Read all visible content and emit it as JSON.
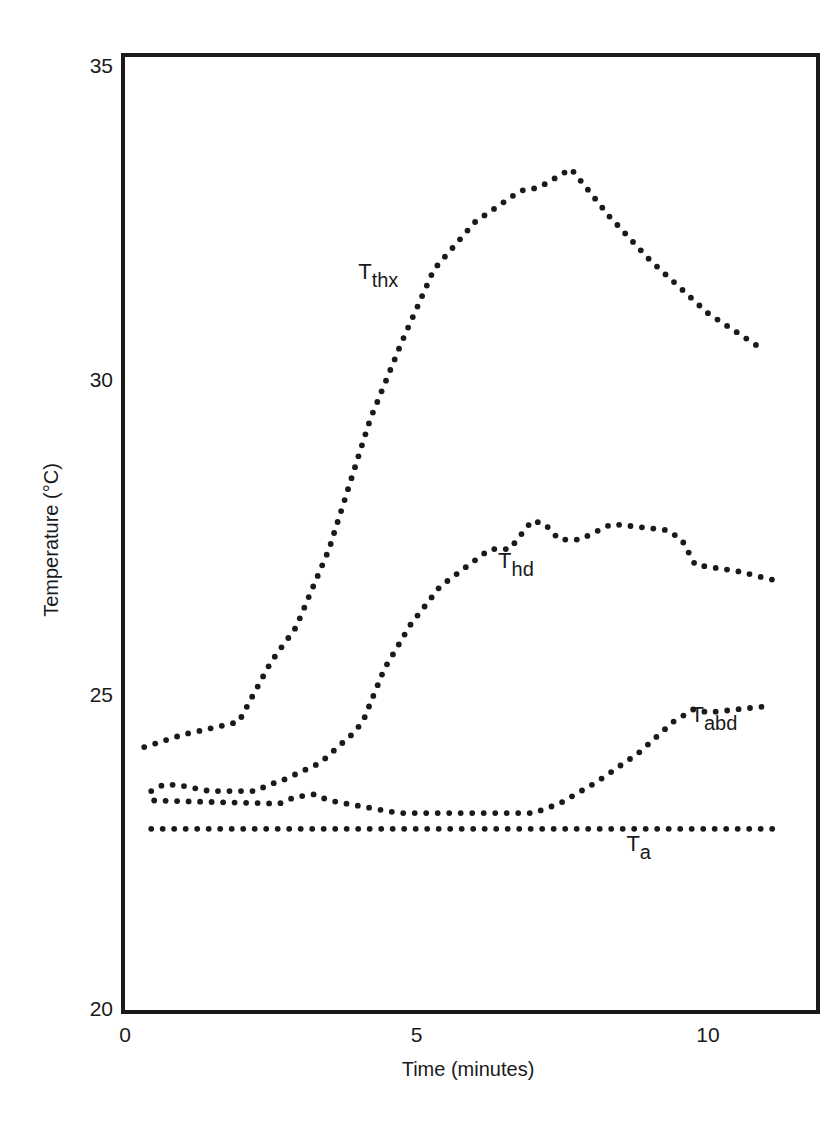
{
  "chart_data": {
    "type": "scatter",
    "style": "dotted-lines",
    "title": "",
    "xlabel": "Time (minutes)",
    "ylabel": "Temperature (°C)",
    "xlim": [
      0,
      12
    ],
    "ylim": [
      20,
      35
    ],
    "x_ticks": [
      0,
      5,
      10
    ],
    "y_ticks": [
      20,
      25,
      30,
      35
    ],
    "grid": false,
    "legend": "inline labels",
    "series": [
      {
        "name": "T_thx",
        "label_main": "T",
        "label_sub": "thx",
        "label_pos": [
          4.0,
          31.6
        ],
        "points": [
          [
            0.33,
            24.15
          ],
          [
            1.0,
            24.35
          ],
          [
            1.95,
            24.55
          ],
          [
            2.5,
            25.5
          ],
          [
            2.93,
            26.05
          ],
          [
            3.5,
            27.3
          ],
          [
            4.2,
            29.35
          ],
          [
            4.75,
            30.6
          ],
          [
            5.3,
            31.75
          ],
          [
            6.0,
            32.5
          ],
          [
            6.78,
            33.0
          ],
          [
            7.1,
            33.05
          ],
          [
            7.65,
            33.35
          ],
          [
            8.3,
            32.6
          ],
          [
            9.0,
            31.9
          ],
          [
            10.0,
            31.05
          ],
          [
            10.9,
            30.5
          ]
        ]
      },
      {
        "name": "T_hd",
        "label_main": "T",
        "label_sub": "hd",
        "label_pos": [
          6.4,
          27.0
        ],
        "points": [
          [
            0.45,
            23.45
          ],
          [
            0.65,
            23.55
          ],
          [
            0.9,
            23.55
          ],
          [
            1.45,
            23.45
          ],
          [
            2.25,
            23.45
          ],
          [
            2.45,
            23.55
          ],
          [
            2.65,
            23.6
          ],
          [
            3.0,
            23.75
          ],
          [
            3.35,
            23.9
          ],
          [
            3.95,
            24.4
          ],
          [
            4.1,
            24.6
          ],
          [
            4.45,
            25.4
          ],
          [
            4.9,
            26.1
          ],
          [
            5.4,
            26.7
          ],
          [
            5.9,
            27.05
          ],
          [
            6.26,
            27.3
          ],
          [
            6.6,
            27.3
          ],
          [
            6.98,
            27.75
          ],
          [
            7.2,
            27.7
          ],
          [
            7.45,
            27.45
          ],
          [
            7.8,
            27.45
          ],
          [
            8.35,
            27.7
          ],
          [
            9.3,
            27.6
          ],
          [
            9.55,
            27.45
          ],
          [
            9.78,
            27.05
          ],
          [
            10.5,
            26.95
          ],
          [
            11.16,
            26.8
          ]
        ]
      },
      {
        "name": "T_abd",
        "label_main": "T",
        "label_sub": "abd",
        "label_pos": [
          9.7,
          24.55
        ],
        "points": [
          [
            0.5,
            23.3
          ],
          [
            2.65,
            23.25
          ],
          [
            2.9,
            23.35
          ],
          [
            3.25,
            23.4
          ],
          [
            3.5,
            23.3
          ],
          [
            4.7,
            23.1
          ],
          [
            5.4,
            23.1
          ],
          [
            7.0,
            23.1
          ],
          [
            7.45,
            23.25
          ],
          [
            8.1,
            23.6
          ],
          [
            8.8,
            24.05
          ],
          [
            9.4,
            24.55
          ],
          [
            9.75,
            24.75
          ],
          [
            10.0,
            24.7
          ],
          [
            11.0,
            24.8
          ]
        ]
      },
      {
        "name": "T_a",
        "label_main": "T",
        "label_sub": "a",
        "label_pos": [
          8.6,
          22.5
        ],
        "points": [
          [
            0.45,
            22.85
          ],
          [
            5.0,
            22.85
          ],
          [
            11.2,
            22.85
          ]
        ]
      }
    ]
  },
  "axes": {
    "x_title": "Time (minutes)",
    "y_title": "Temperature (°C)",
    "x_tick_labels": [
      "0",
      "5",
      "10"
    ],
    "y_tick_labels": [
      "20",
      "25",
      "30",
      "35"
    ]
  },
  "colors": {
    "ink": "#1a1a1a",
    "background": "#ffffff"
  }
}
